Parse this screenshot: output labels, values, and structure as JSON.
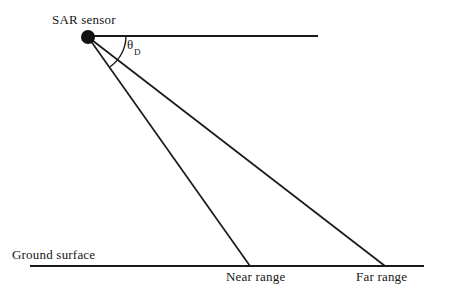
{
  "diagram": {
    "background_color": "#ffffff",
    "stroke_color": "#1a1a1a",
    "labels": {
      "sensor": "SAR sensor",
      "ground_surface": "Ground surface",
      "near_range": "Near range",
      "far_range": "Far range",
      "depression_angle_symbol": "θ",
      "depression_angle_subscript": "D"
    },
    "geometry": {
      "sensor_point": {
        "x": 88,
        "y": 37,
        "radius": 7
      },
      "horizontal_reference_line": {
        "x1": 88,
        "y1": 36,
        "x2": 318,
        "y2": 36
      },
      "ground_line": {
        "x1": 30,
        "y1": 266,
        "x2": 424,
        "y2": 266
      },
      "near_range_beam": {
        "x1": 88,
        "y1": 37,
        "x2": 250,
        "y2": 266
      },
      "far_range_beam": {
        "x1": 88,
        "y1": 37,
        "x2": 385,
        "y2": 266
      },
      "angle_arc": {
        "center_x": 88,
        "center_y": 37,
        "radius": 38
      }
    }
  }
}
